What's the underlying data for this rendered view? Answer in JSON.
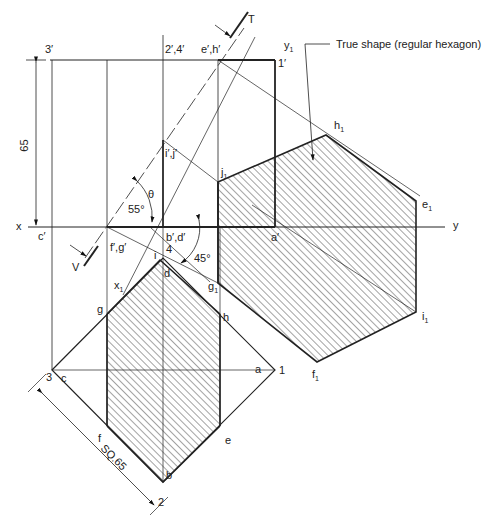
{
  "annotation": {
    "true_shape_note": "True shape (regular hexagon)"
  },
  "reference_line": {
    "x_label": "x",
    "y_label": "y",
    "aux_label": "y1",
    "aux_x_label": "x1"
  },
  "cutting_plane": {
    "top_label": "T",
    "bottom_label": "V"
  },
  "dimensions": {
    "height": "65",
    "angle_plane": "55°",
    "angle_theta": "θ",
    "angle_square": "45°",
    "square_side": "SQ.65"
  },
  "elevation_labels": {
    "p3": "3′",
    "p24": "2′,4′",
    "eh": "e′,h′",
    "p1": "1′",
    "ij": "i′,j′",
    "c": "c′",
    "fg": "f′,g′",
    "bd": "b′,d′",
    "p4": "4",
    "a": "a′"
  },
  "plan_labels": {
    "p3": "3",
    "c": "c",
    "g": "g",
    "h": "h",
    "i": "i",
    "d": "d",
    "a": "a",
    "p1": "1",
    "f": "f",
    "e": "e",
    "b": "b",
    "p2": "2"
  },
  "true_shape_labels": {
    "j1": "j",
    "h1": "h",
    "e1": "e",
    "i1": "i",
    "f1": "f",
    "g1": "g",
    "sub": "1"
  },
  "colors": {
    "line": "#222222",
    "hatch": "#333333",
    "background": "#ffffff"
  }
}
